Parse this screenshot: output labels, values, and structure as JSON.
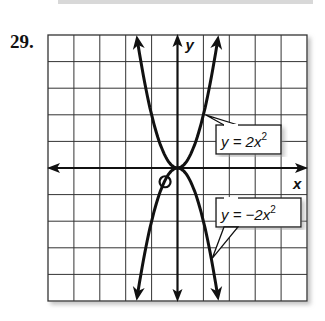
{
  "problem_number": "29.",
  "chart_data": {
    "type": "line",
    "title": "",
    "xlabel": "x",
    "ylabel": "y",
    "xlim": [
      -5,
      5
    ],
    "ylim": [
      -5,
      5
    ],
    "grid": true,
    "series": [
      {
        "name": "y = 2x^2",
        "label": "y = 2x²",
        "x": [
          -1.58,
          -1,
          0,
          1,
          1.58
        ],
        "values": [
          5,
          2,
          0,
          2,
          5
        ]
      },
      {
        "name": "y = -2x^2",
        "label": "y = −2x²",
        "x": [
          -1.58,
          -1,
          0,
          1,
          1.58
        ],
        "values": [
          -5,
          -2,
          0,
          -2,
          -5
        ]
      }
    ],
    "annotations": [
      {
        "text": "y = 2x²",
        "points_to": [
          1,
          2
        ]
      },
      {
        "text": "y = −2x²",
        "points_to": [
          1.3,
          -3.4
        ]
      },
      {
        "text": "circled point",
        "at": [
          -0.5,
          -0.5
        ]
      }
    ]
  },
  "labels": {
    "x_axis": "x",
    "y_axis": "y",
    "eq1": "y = 2x",
    "eq2": "y = −2x",
    "sup": "2"
  }
}
